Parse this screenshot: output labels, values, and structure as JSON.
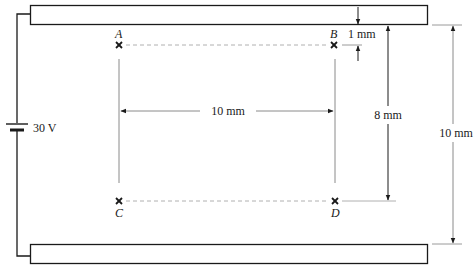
{
  "diagram": {
    "type": "parallel-plate capacitor field diagram",
    "colors": {
      "ink": "#1a1a1a",
      "guide": "#9a9a9a",
      "dashed": "#b0b0b0",
      "background": "#ffffff"
    },
    "battery": {
      "label": "30 V"
    },
    "points": [
      {
        "id": "A",
        "label": "A"
      },
      {
        "id": "B",
        "label": "B"
      },
      {
        "id": "C",
        "label": "C"
      },
      {
        "id": "D",
        "label": "D"
      }
    ],
    "dimensions": {
      "ab_to_plate": "1 mm",
      "a_to_b": "10 mm",
      "plate_to_cd": "8 mm",
      "plate_separation": "10 mm"
    }
  }
}
